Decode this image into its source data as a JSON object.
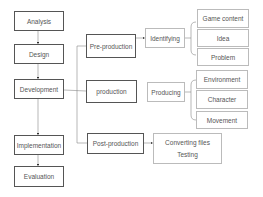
{
  "diagram": {
    "phases": [
      {
        "label": "Analysis"
      },
      {
        "label": "Design"
      },
      {
        "label": "Development"
      },
      {
        "label": "Implementation"
      },
      {
        "label": "Evaluation"
      }
    ],
    "development_stages": [
      {
        "label": "Pre-production"
      },
      {
        "label": "production"
      },
      {
        "label": "Post-production"
      }
    ],
    "pre_production": {
      "action": "Identifying",
      "items": [
        {
          "label": "Game content"
        },
        {
          "label": "Idea"
        },
        {
          "label": "Problem"
        }
      ]
    },
    "production": {
      "action": "Producing",
      "items": [
        {
          "label": "Environment"
        },
        {
          "label": "Character"
        },
        {
          "label": "Movement"
        }
      ]
    },
    "post_production": {
      "items": [
        {
          "label": "Converting files"
        },
        {
          "label": "Testing"
        }
      ]
    },
    "colors": {
      "phase_border": "#555555",
      "sub_border": "#bbbbbb",
      "text": "#555555",
      "connector": "#777777"
    }
  }
}
